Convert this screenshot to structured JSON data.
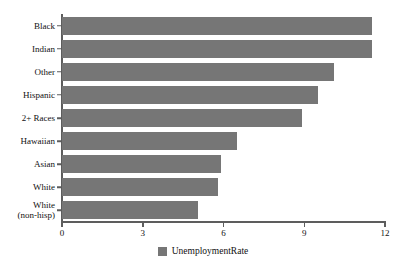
{
  "chart_data": {
    "type": "bar",
    "orientation": "horizontal",
    "title": "",
    "xlabel": "",
    "ylabel": "",
    "categories": [
      "Black",
      "Indian",
      "Other",
      "Hispanic",
      "2+ Races",
      "Hawaiian",
      "Asian",
      "White",
      "White (non-hisp)"
    ],
    "values": [
      11.5,
      11.5,
      10.1,
      9.5,
      8.9,
      6.5,
      5.9,
      5.8,
      5.05
    ],
    "series": [
      {
        "name": "UnemploymentRate",
        "values": [
          11.5,
          11.5,
          10.1,
          9.5,
          8.9,
          6.5,
          5.9,
          5.8,
          5.05
        ],
        "color": "#767676"
      }
    ],
    "xlim": [
      0,
      12
    ],
    "xticks": [
      0,
      3,
      6,
      9,
      12
    ],
    "xtick_labels": [
      "0",
      "3",
      "6",
      "9",
      "12"
    ],
    "grid": false,
    "legend": {
      "position": "bottom",
      "entries": [
        {
          "label": "UnemploymentRate",
          "color": "#767676"
        }
      ]
    },
    "axis_color": "#5d5d5d",
    "background": "#ffffff"
  }
}
